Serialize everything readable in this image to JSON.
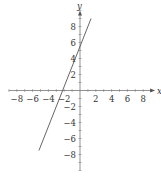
{
  "chart_data": {
    "type": "line",
    "title": "",
    "xlabel": "x",
    "ylabel": "y",
    "xlim": [
      -9,
      9.5
    ],
    "ylim": [
      -10,
      10
    ],
    "grid": false,
    "legend": null,
    "x_ticks": [
      -8,
      -6,
      -4,
      -2,
      2,
      4,
      6,
      8
    ],
    "y_ticks": [
      -8,
      -6,
      -4,
      -2,
      2,
      4,
      6,
      8
    ],
    "x_tick_labels": [
      "−8",
      "−6",
      "−4",
      "−2",
      "2",
      "4",
      "6",
      "8"
    ],
    "y_tick_labels": [
      "−8",
      "−6",
      "−4",
      "−2",
      "2",
      "4",
      "6",
      "8"
    ],
    "minor_ticks_per_unit": 1,
    "series": [
      {
        "name": "line",
        "equation": "y = 2.5x + 5.5",
        "slope": 2.5,
        "intercept": 5.5,
        "x_intercept": -2.2,
        "x": [
          -5.2,
          1.4
        ],
        "y": [
          -7.5,
          9.0
        ],
        "color": "#555555"
      }
    ]
  },
  "axes": {
    "x_name": "x",
    "y_name": "y",
    "axis_color": "#777777"
  }
}
